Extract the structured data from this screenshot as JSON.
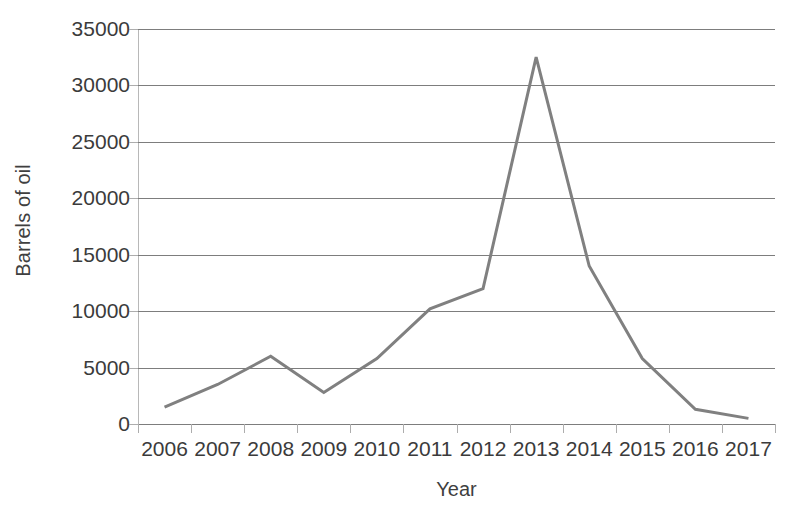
{
  "chart_data": {
    "type": "line",
    "title": "",
    "xlabel": "Year",
    "ylabel": "Barrels of oil",
    "categories": [
      "2006",
      "2007",
      "2008",
      "2009",
      "2010",
      "2011",
      "2012",
      "2013",
      "2014",
      "2015",
      "2016",
      "2017"
    ],
    "values": [
      1500,
      3500,
      6000,
      2800,
      5800,
      10200,
      12000,
      32500,
      14000,
      5800,
      1300,
      500
    ],
    "series": [
      {
        "name": "Barrels of oil",
        "values": [
          1500,
          3500,
          6000,
          2800,
          5800,
          10200,
          12000,
          32500,
          14000,
          5800,
          1300,
          500
        ]
      }
    ],
    "ylim": [
      0,
      35000
    ],
    "ytick_labels": [
      "0",
      "5000",
      "10000",
      "15000",
      "20000",
      "25000",
      "30000",
      "35000"
    ],
    "ytick_values": [
      0,
      5000,
      10000,
      15000,
      20000,
      25000,
      30000,
      35000
    ],
    "grid": true,
    "grid_axis": "y",
    "legend": false,
    "legend_position": "none",
    "line_color": "#808080",
    "line_width": 3,
    "markers": false,
    "background_color": "#ffffff",
    "gridline_color": "#7d7d7d",
    "text_color": "#3b3b3b"
  }
}
